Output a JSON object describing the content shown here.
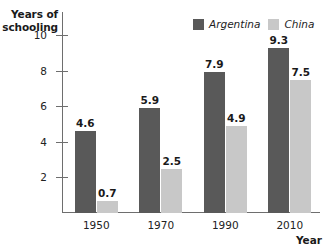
{
  "chart_data": {
    "type": "bar",
    "title": "",
    "xlabel": "Year",
    "ylabel": "Years of schooling",
    "categories": [
      "1950",
      "1970",
      "1990",
      "2010"
    ],
    "series": [
      {
        "name": "Argentina",
        "color": "#595959",
        "values": [
          4.6,
          5.9,
          7.9,
          9.3
        ]
      },
      {
        "name": "China",
        "color": "#c8c8c8",
        "values": [
          0.7,
          2.5,
          4.9,
          7.5
        ]
      }
    ],
    "value_labels": {
      "Argentina": [
        "4.6",
        "5.9",
        "7.9",
        "9.3"
      ],
      "China": [
        "0.7",
        "2.5",
        "4.9",
        "7.5"
      ]
    },
    "yticks": [
      2,
      4,
      6,
      8,
      10
    ],
    "ytick_labels": [
      "2",
      "4",
      "6",
      "8",
      "10"
    ],
    "ylim": [
      0,
      11.3
    ],
    "grid": false,
    "legend_position": "top-right"
  },
  "axis": {
    "y_title_line1": "Years of",
    "y_title_line2": "schooling",
    "x_title": "Year"
  },
  "legend": {
    "items": [
      {
        "label": "Argentina",
        "swatch": "legend-swatch-argentina"
      },
      {
        "label": "China",
        "swatch": "legend-swatch-china"
      }
    ]
  },
  "colors": {
    "argentina": "#595959",
    "china": "#c8c8c8",
    "axis": "#6e6e6e",
    "text": "#222222",
    "background": "#ffffff"
  }
}
